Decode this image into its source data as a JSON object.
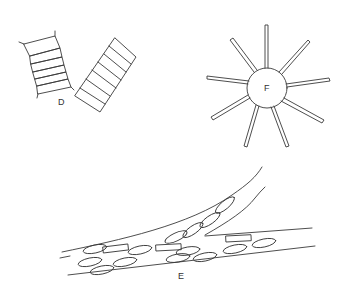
{
  "figure": {
    "panels": [
      {
        "id": "D",
        "label": "D",
        "description": "two chain-like colonies of rectangular cells"
      },
      {
        "id": "F",
        "label": "F",
        "description": "stellate colony with radiating cells"
      },
      {
        "id": "E",
        "label": "E",
        "description": "elongate filaments with elliptical and rectangular cells"
      }
    ],
    "colors": {
      "line": "#3a3a3a",
      "background": "#ffffff"
    }
  }
}
